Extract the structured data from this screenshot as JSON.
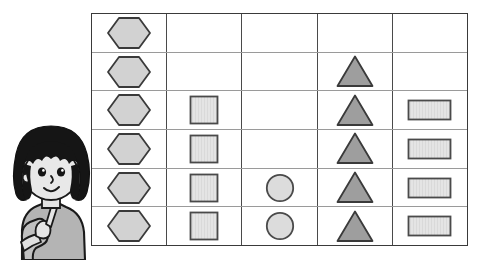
{
  "scene": {
    "description": "shape pictograph worksheet with cartoon girl pointing",
    "background_color": "#ffffff"
  },
  "character": {
    "name": "cartoon-girl",
    "pose": "pointing-up-with-index-finger",
    "hair_color": "#151515",
    "skin_color": "#e3e3e3",
    "shirt_color": "#b4b4b4",
    "outline_color": "#1a1a1a"
  },
  "chart_data": {
    "type": "bar",
    "title": "",
    "subtitle": "",
    "xlabel": "",
    "ylabel": "",
    "grid": true,
    "legend_position": "none",
    "orientation": "vertical",
    "rows": 6,
    "columns": 5,
    "fill_direction": "bottom-up",
    "ylim": [
      0,
      6
    ],
    "categories": [
      "hexagon",
      "square",
      "circle",
      "triangle",
      "rectangle"
    ],
    "values": [
      6,
      4,
      2,
      5,
      4
    ],
    "tick_labels": [
      "1",
      "2",
      "3",
      "4",
      "5",
      "6"
    ],
    "series": [
      {
        "name": "shape count",
        "values": [
          6,
          4,
          2,
          5,
          4
        ]
      }
    ],
    "cells": [
      [
        "hexagon",
        "empty",
        "empty",
        "empty",
        "empty"
      ],
      [
        "hexagon",
        "empty",
        "empty",
        "triangle",
        "empty"
      ],
      [
        "hexagon",
        "square",
        "empty",
        "triangle",
        "rectangle"
      ],
      [
        "hexagon",
        "square",
        "empty",
        "triangle",
        "rectangle"
      ],
      [
        "hexagon",
        "square",
        "circle",
        "triangle",
        "rectangle"
      ],
      [
        "hexagon",
        "square",
        "circle",
        "triangle",
        "rectangle"
      ]
    ]
  },
  "shape_styles": {
    "hexagon": {
      "fill": "#d2d2d2",
      "stroke": "#3a3a3a"
    },
    "square": {
      "fill": "#d0d0d0",
      "stroke": "#4a4a4a"
    },
    "circle": {
      "fill": "#dcdcdc",
      "stroke": "#4a4a4a"
    },
    "triangle": {
      "fill": "#9e9e9e",
      "stroke": "#3a3a3a"
    },
    "rectangle": {
      "fill": "#e2e2e2",
      "stroke": "#4a4a4a"
    }
  },
  "grid_style": {
    "outer_border_color": "#3a3a3a",
    "column_divider_color": "#4a4a4a",
    "row_divider_color": "#9a9a9a"
  }
}
